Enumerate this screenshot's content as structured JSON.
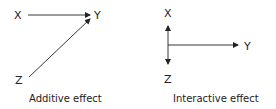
{
  "diagrams": [
    {
      "caption": "Additive effect",
      "nodes": {
        "x": "X",
        "y": "Y",
        "z": "Z"
      },
      "edges": [
        {
          "from": "X",
          "to": "Y"
        },
        {
          "from": "Z",
          "to": "Y"
        }
      ]
    },
    {
      "caption": "Interactive effect",
      "nodes": {
        "x": "X",
        "y": "Y",
        "z": "Z"
      },
      "edges": [
        {
          "from": "X-Z axis",
          "to": "Y"
        }
      ]
    }
  ]
}
